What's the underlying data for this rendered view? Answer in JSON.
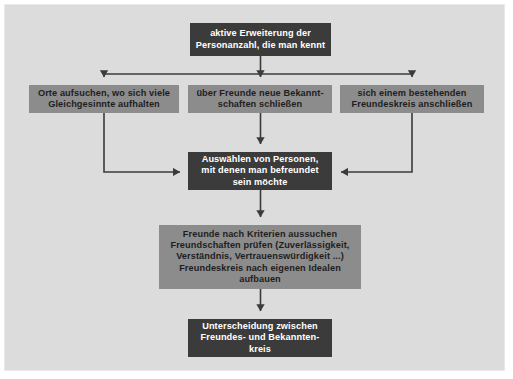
{
  "diagram": {
    "colors": {
      "background": "#dcdcdc",
      "dark_node": "#3b3b3b",
      "gray_node": "#8c8c8c",
      "edge": "#3b3b3b",
      "dark_node_text": "#ffffff",
      "gray_node_text": "#1e1e1e"
    },
    "nodes": [
      {
        "id": "top",
        "style": "dark",
        "lines": [
          "aktive Erweiterung der",
          "Personanzahl, die man kennt"
        ]
      },
      {
        "id": "left",
        "style": "gray",
        "lines": [
          "Orte aufsuchen, wo sich viele",
          "Gleichgesinnte aufhalten"
        ]
      },
      {
        "id": "mid",
        "style": "gray",
        "lines": [
          "über Freunde neue Bekannt-",
          "schaften schließen"
        ]
      },
      {
        "id": "right",
        "style": "gray",
        "lines": [
          "sich einem bestehenden",
          "Freundeskreis anschließen"
        ]
      },
      {
        "id": "select",
        "style": "dark",
        "lines": [
          "Auswählen von Personen,",
          "mit denen man befreundet",
          "sein möchte"
        ]
      },
      {
        "id": "criteria",
        "style": "gray",
        "lines": [
          "Freunde nach Kriterien aussuchen",
          "Freundschaften prüfen (Zuverlässigkeit,",
          "Verständnis, Vertrauenswürdigkeit ...)",
          "Freundeskreis nach eigenen Idealen",
          "aufbauen"
        ]
      },
      {
        "id": "bottom",
        "style": "dark",
        "lines": [
          "Unterscheidung zwischen",
          "Freundes- und Bekannten-",
          "kreis"
        ]
      }
    ],
    "edges": [
      {
        "from": "top",
        "to": "left",
        "kind": "branch-down-arrow"
      },
      {
        "from": "top",
        "to": "mid",
        "kind": "straight-down-arrow"
      },
      {
        "from": "top",
        "to": "right",
        "kind": "branch-down-arrow"
      },
      {
        "from": "left",
        "to": "select",
        "kind": "elbow-right-arrow"
      },
      {
        "from": "mid",
        "to": "select",
        "kind": "straight-down-arrow"
      },
      {
        "from": "right",
        "to": "select",
        "kind": "elbow-left-arrow"
      },
      {
        "from": "select",
        "to": "criteria",
        "kind": "straight-down-arrow"
      },
      {
        "from": "criteria",
        "to": "bottom",
        "kind": "straight-down-arrow"
      }
    ]
  }
}
